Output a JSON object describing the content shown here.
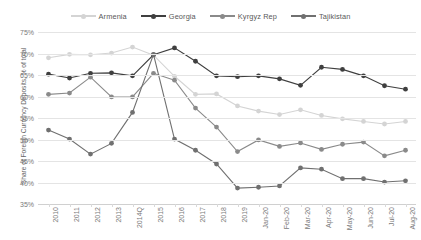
{
  "chart_data": {
    "type": "line",
    "title": "",
    "xlabel": "",
    "ylabel": "Share of Foreign Currency Deposits, % of total",
    "ylim": [
      35,
      75
    ],
    "ytick_step": 5,
    "ytick_labels": [
      "75%",
      "70%",
      "65%",
      "60%",
      "55%",
      "50%",
      "45%",
      "40%",
      "35%"
    ],
    "ytick_values": [
      75,
      70,
      65,
      60,
      55,
      50,
      45,
      40,
      35
    ],
    "grid": true,
    "legend_position": "top-center",
    "categories": [
      "2010",
      "2011",
      "2012",
      "2013",
      "2014Q",
      "2015",
      "2016",
      "2017",
      "2018",
      "2019",
      "Jan-20",
      "Feb-20",
      "Mar-20",
      "Apr-20",
      "May-20",
      "Jun-20",
      "Jul-20",
      "Aug-20"
    ],
    "series": [
      {
        "name": "Armenia",
        "color": "#d4d4d4",
        "values": [
          69.0,
          69.8,
          69.7,
          70.1,
          71.5,
          69.6,
          64.7,
          60.5,
          60.6,
          57.8,
          56.6,
          55.8,
          56.9,
          55.6,
          54.8,
          54.2,
          53.6,
          54.2
        ]
      },
      {
        "name": "Georgia",
        "color": "#3f3f3f",
        "values": [
          65.2,
          64.3,
          65.4,
          65.5,
          64.8,
          69.7,
          71.3,
          68.2,
          64.8,
          64.6,
          64.8,
          64.1,
          62.6,
          66.8,
          66.3,
          64.8,
          62.5,
          61.7
        ]
      },
      {
        "name": "Kyrgyz Rep",
        "color": "#8a8a8a",
        "values": [
          60.5,
          60.8,
          64.5,
          59.9,
          59.9,
          65.4,
          63.8,
          57.3,
          52.9,
          47.2,
          49.9,
          48.4,
          49.2,
          47.7,
          48.9,
          49.4,
          46.2,
          47.5
        ]
      },
      {
        "name": "Tajikistan",
        "color": "#707070",
        "values": [
          52.2,
          50.1,
          46.6,
          49.1,
          56.3,
          69.8,
          50.1,
          47.5,
          44.3,
          38.7,
          38.9,
          39.2,
          43.4,
          43.1,
          40.9,
          40.9,
          40.1,
          40.4
        ]
      }
    ]
  }
}
